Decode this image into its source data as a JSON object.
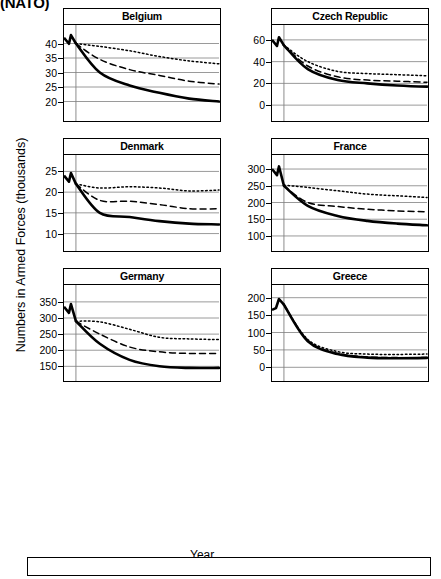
{
  "header": {
    "clipped_title": "(NATO)"
  },
  "axes": {
    "ylabel": "Numbers in Armed Forces (thousands)",
    "xlabel": "Year",
    "xticks": [
      "2002",
      "2010",
      "2020",
      "2030",
      "2040",
      "2050"
    ]
  },
  "legend": {
    "items": [
      {
        "label": "Low 1.5 per thousand",
        "style": "solid"
      },
      {
        "label": "Medium 2.0 per thousand",
        "style": "dashed"
      },
      {
        "label": "High 2.5 per thousand",
        "style": "dotted"
      }
    ]
  },
  "colors": {
    "line": "#000000",
    "grid": "#808080",
    "frame": "#000000"
  },
  "chart_data": {
    "type": "line",
    "title": "(NATO)",
    "xlabel": "Year",
    "ylabel": "Numbers in Armed Forces (thousands)",
    "grid": true,
    "legend_position": "bottom",
    "x": [
      1998,
      2002,
      2010,
      2020,
      2030,
      2040,
      2050
    ],
    "series_names": [
      "Low 1.5 per thousand",
      "Medium 2.0 per thousand",
      "High 2.5 per thousand"
    ],
    "panels": [
      {
        "name": "Belgium",
        "ylim": [
          15,
          45
        ],
        "yticks": [
          20,
          25,
          30,
          35,
          40
        ],
        "series": [
          {
            "name": "Low 1.5 per thousand",
            "values": [
              42,
              40,
              30,
              25.5,
              23,
              21,
              20
            ]
          },
          {
            "name": "Medium 2.0 per thousand",
            "values": [
              42,
              40,
              34.5,
              31,
              29,
              27,
              26
            ]
          },
          {
            "name": "High 2.5 per thousand",
            "values": [
              42,
              40,
              39,
              37.5,
              35.5,
              34,
              33
            ]
          }
        ]
      },
      {
        "name": "Czech Republic",
        "ylim": [
          -10,
          70
        ],
        "yticks": [
          0,
          20,
          40,
          60
        ],
        "series": [
          {
            "name": "Low 1.5 per thousand",
            "values": [
              60,
              55,
              33,
              23,
              20,
              18,
              17
            ]
          },
          {
            "name": "Medium 2.0 per thousand",
            "values": [
              60,
              55,
              36,
              26,
              23,
              22,
              21
            ]
          },
          {
            "name": "High 2.5 per thousand",
            "values": [
              60,
              55,
              40,
              31,
              29,
              28,
              27
            ]
          }
        ]
      },
      {
        "name": "Denmark",
        "ylim": [
          7,
          28
        ],
        "yticks": [
          10,
          15,
          20,
          25
        ],
        "series": [
          {
            "name": "Low 1.5 per thousand",
            "values": [
              24,
              22,
              15,
              14,
              13,
              12.4,
              12.2
            ]
          },
          {
            "name": "Medium 2.0 per thousand",
            "values": [
              24,
              22,
              18,
              17.8,
              17,
              16,
              16
            ]
          },
          {
            "name": "High 2.5 per thousand",
            "values": [
              24,
              22,
              21,
              21.3,
              21,
              20.3,
              20.5
            ]
          }
        ]
      },
      {
        "name": "France",
        "ylim": [
          70,
          330
        ],
        "yticks": [
          100,
          150,
          200,
          250,
          300
        ],
        "series": [
          {
            "name": "Low 1.5 per thousand",
            "values": [
              300,
              250,
              190,
              160,
              145,
              137,
              132
            ]
          },
          {
            "name": "Medium 2.0 per thousand",
            "values": [
              300,
              250,
              200,
              188,
              180,
              175,
              172
            ]
          },
          {
            "name": "High 2.5 per thousand",
            "values": [
              300,
              252,
              245,
              235,
              225,
              220,
              215
            ]
          }
        ]
      },
      {
        "name": "Germany",
        "ylim": [
          120,
          390
        ],
        "yticks": [
          150,
          200,
          250,
          300,
          350
        ],
        "series": [
          {
            "name": "Low 1.5 per thousand",
            "values": [
              335,
              290,
              220,
              170,
              150,
              145,
              145
            ]
          },
          {
            "name": "Medium 2.0 per thousand",
            "values": [
              335,
              290,
              250,
              210,
              195,
              190,
              190
            ]
          },
          {
            "name": "High 2.5 per thousand",
            "values": [
              335,
              290,
              288,
              265,
              240,
              235,
              233
            ]
          }
        ]
      },
      {
        "name": "Greece",
        "ylim": [
          -25,
          225
        ],
        "yticks": [
          0,
          50,
          100,
          150,
          200
        ],
        "series": [
          {
            "name": "Low 1.5 per thousand",
            "values": [
              165,
              180,
              75,
              38,
              28,
              26,
              27
            ]
          },
          {
            "name": "Medium 2.0 per thousand",
            "values": [
              165,
              180,
              77,
              40,
              30,
              28,
              28
            ]
          },
          {
            "name": "High 2.5 per thousand",
            "values": [
              165,
              180,
              80,
              45,
              38,
              37,
              38
            ]
          }
        ]
      },
      {
        "name": "Hungary",
        "ylim": [
          5,
          48
        ],
        "yticks": [
          10,
          20,
          30,
          40
        ],
        "series": [
          {
            "name": "Low 1.5 per thousand",
            "values": [
              44,
              33,
              29,
              23,
              20,
              18,
              16.5
            ]
          },
          {
            "name": "Medium 2.0 per thousand",
            "values": [
              44,
              33,
              33,
              30,
              27,
              24,
              21.5
            ]
          },
          {
            "name": "High 2.5 per thousand",
            "values": [
              44,
              33,
              37.5,
              35,
              32,
              29,
              26.5
            ]
          }
        ]
      },
      {
        "name": "Italy",
        "ylim": [
          70,
          280
        ],
        "yticks": [
          100,
          150,
          200,
          250
        ],
        "series": [
          {
            "name": "Low 1.5 per thousand",
            "values": [
              265,
              200,
              150,
              120,
              105,
              97,
              92
            ]
          },
          {
            "name": "Medium 2.0 per thousand",
            "values": [
              265,
              200,
              172,
              145,
              133,
              126,
              120
            ]
          },
          {
            "name": "High 2.5 per thousand",
            "values": [
              265,
              202,
              190,
              175,
              163,
              153,
              147
            ]
          }
        ]
      }
    ]
  }
}
